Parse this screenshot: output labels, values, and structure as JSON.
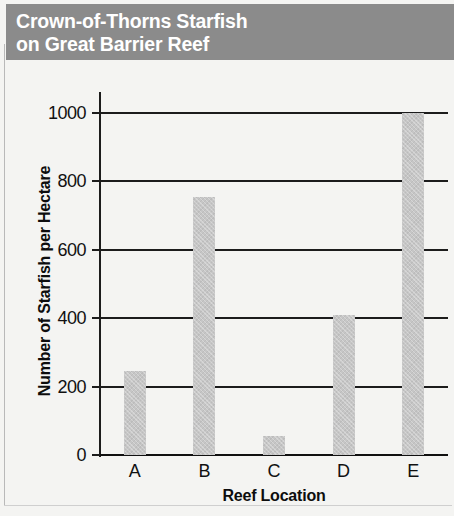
{
  "title": {
    "line1": "Crown-of-Thorns Starfish",
    "line2": "on Great Barrier Reef"
  },
  "colors": {
    "banner_background": "#8b8b8b",
    "title_text": "#ffffff",
    "bar_fill": "#c6c6c6",
    "axis": "#1c1c1c",
    "plot_background": "#f4f4f2"
  },
  "chart_data": {
    "type": "bar",
    "title": "Crown-of-Thorns Starfish on Great Barrier Reef",
    "categories": [
      "A",
      "B",
      "C",
      "D",
      "E"
    ],
    "values": [
      245,
      755,
      55,
      410,
      1000
    ],
    "xlabel": "Reef Location",
    "ylabel": "Number of Starfish per Hectare",
    "ylim": [
      0,
      1000
    ],
    "yticks": [
      0,
      200,
      400,
      600,
      800,
      1000
    ],
    "ytick_labels": [
      "0",
      "200",
      "400",
      "600",
      "800",
      "1000"
    ],
    "grid": true,
    "grid_axis": "y",
    "legend": false
  }
}
